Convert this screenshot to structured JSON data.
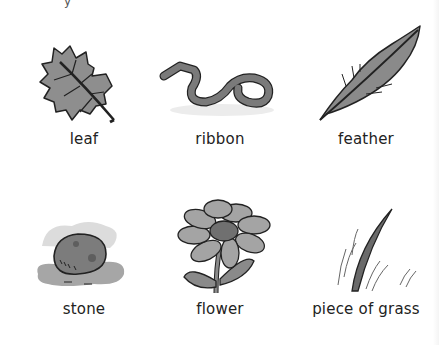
{
  "top_fragment": "y",
  "items": [
    {
      "label": "leaf",
      "icon": "leaf-icon"
    },
    {
      "label": "ribbon",
      "icon": "ribbon-icon"
    },
    {
      "label": "feather",
      "icon": "feather-icon"
    },
    {
      "label": "stone",
      "icon": "stone-icon"
    },
    {
      "label": "flower",
      "icon": "flower-icon"
    },
    {
      "label": "piece of grass",
      "icon": "grass-icon"
    }
  ],
  "colors": {
    "ink": "#222222",
    "fill_dark": "#6e6e6e",
    "fill_mid": "#9a9a9a",
    "fill_light": "#c8c8c8",
    "shadow": "#e6e6e6"
  }
}
